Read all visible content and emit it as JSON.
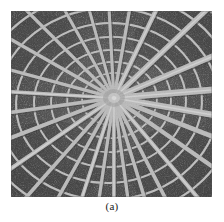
{
  "figure": {
    "caption": "(a)",
    "alt_description": "Grayscale photograph of a spider web with radial spokes converging at an off-center hub and concentric spiral capture threads",
    "image_type": "grayscale-photograph",
    "colors": {
      "page_background": "#ffffff",
      "web_background_dark": "#3a3a3a",
      "web_background_darkest": "#2b2b2b",
      "web_background_mid": "#575757",
      "strand_bright": "#e8e8e8",
      "strand_mid": "#b8b8b8",
      "caption_text": "#1a1a1a"
    },
    "geometry": {
      "frame_x": 11,
      "frame_y": 11,
      "frame_width": 201,
      "frame_height": 186,
      "hub_x": 103,
      "hub_y": 87,
      "radial_spoke_count": 26,
      "spiral_ring_count": 11
    }
  }
}
